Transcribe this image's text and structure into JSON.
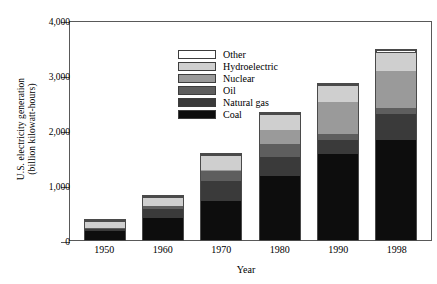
{
  "chart_data": {
    "type": "bar",
    "stacked": true,
    "title": "",
    "xlabel": "Year",
    "ylabel": "U.S. electricity generation (billion kilowatt-hours)",
    "ylabel_line1": "U.S. electricity generation",
    "ylabel_line2": "(billion kilowatt-hours)",
    "categories": [
      "1950",
      "1960",
      "1970",
      "1980",
      "1990",
      "1998"
    ],
    "ylim": [
      0,
      4000
    ],
    "yticks": [
      0,
      1000,
      2000,
      3000,
      4000
    ],
    "ytick_labels": [
      "0",
      "1,000",
      "2,000",
      "3,000",
      "4,000"
    ],
    "grid": false,
    "legend_position": "upper-left-inside",
    "series": [
      {
        "name": "Coal",
        "key": "coal",
        "color": "#0d0d0d",
        "values": [
          155,
          405,
          705,
          1160,
          1560,
          1810
        ]
      },
      {
        "name": "Natural gas",
        "key": "gas",
        "color": "#3a3a3a",
        "values": [
          45,
          155,
          370,
          345,
          260,
          480
        ]
      },
      {
        "name": "Oil",
        "key": "oil",
        "color": "#5e5e5e",
        "values": [
          20,
          50,
          180,
          240,
          110,
          110
        ]
      },
      {
        "name": "Nuclear",
        "key": "nuclear",
        "color": "#9a9a9a",
        "values": [
          0,
          5,
          20,
          250,
          575,
          675
        ]
      },
      {
        "name": "Hydroelectric",
        "key": "hydro",
        "color": "#cfcfcf",
        "values": [
          100,
          150,
          250,
          275,
          290,
          320
        ]
      },
      {
        "name": "Other",
        "key": "other",
        "color": "#ffffff",
        "values": [
          10,
          10,
          25,
          10,
          40,
          60
        ]
      }
    ],
    "totals": [
      330,
      775,
      1550,
      2280,
      2835,
      3455
    ],
    "legend_order": [
      "Other",
      "Hydroelectric",
      "Nuclear",
      "Oil",
      "Natural gas",
      "Coal"
    ]
  },
  "legend": {
    "items": [
      {
        "label": "Other",
        "key": "other",
        "color": "#ffffff"
      },
      {
        "label": "Hydroelectric",
        "key": "hydro",
        "color": "#cfcfcf"
      },
      {
        "label": "Nuclear",
        "key": "nuclear",
        "color": "#9a9a9a"
      },
      {
        "label": "Oil",
        "key": "oil",
        "color": "#5e5e5e"
      },
      {
        "label": "Natural gas",
        "key": "gas",
        "color": "#3a3a3a"
      },
      {
        "label": "Coal",
        "key": "coal",
        "color": "#0d0d0d"
      }
    ]
  }
}
